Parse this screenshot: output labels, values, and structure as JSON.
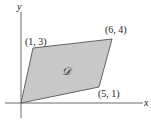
{
  "figure": {
    "axes": {
      "x_label": "x",
      "y_label": "y"
    },
    "region": {
      "label": "𝒟",
      "fill": "#c8c8c8",
      "stroke": "#555555",
      "vertices": [
        {
          "label": "(0, 0)",
          "x": 0,
          "y": 0,
          "shown": false
        },
        {
          "label": "(5, 1)",
          "x": 5,
          "y": 1,
          "shown": true
        },
        {
          "label": "(6, 4)",
          "x": 6,
          "y": 4,
          "shown": true
        },
        {
          "label": "(1, 3)",
          "x": 1,
          "y": 3,
          "shown": true
        }
      ]
    },
    "vertex_labels": {
      "v1": "(5, 1)",
      "v2": "(6, 4)",
      "v3": "(1, 3)"
    }
  }
}
